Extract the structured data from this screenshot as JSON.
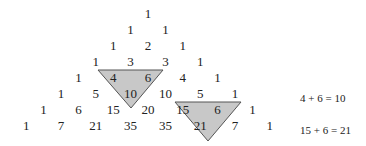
{
  "figure": {
    "rows": [
      [
        "1"
      ],
      [
        "1",
        "1"
      ],
      [
        "1",
        "2",
        "1"
      ],
      [
        "1",
        "3",
        "3",
        "1"
      ],
      [
        "1",
        "4",
        "6",
        "4",
        "1"
      ],
      [
        "1",
        "5",
        "10",
        "10",
        "5",
        "1"
      ],
      [
        "1",
        "6",
        "15",
        "20",
        "15",
        "6",
        "1"
      ],
      [
        "1",
        "7",
        "21",
        "35",
        "35",
        "21",
        "7",
        "1"
      ]
    ],
    "highlights": [
      {
        "cells": [
          "4",
          "6",
          "10"
        ],
        "fill": "#c8c8c8",
        "stroke": "#555555"
      },
      {
        "cells": [
          "15",
          "6",
          "21"
        ],
        "fill": "#c8c8c8",
        "stroke": "#555555"
      }
    ],
    "equations": [
      "4 + 6 = 10",
      "15 + 6 = 21"
    ]
  }
}
